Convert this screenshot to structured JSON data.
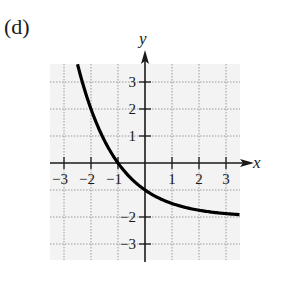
{
  "panel_label": "(d)",
  "colors": {
    "curve": "#000000",
    "axis": "#1a1a1a",
    "grid": "#9a9a9a",
    "grid_background": "#f3f3f3"
  },
  "chart_data": {
    "type": "line",
    "title": "(d)",
    "xlabel": "x",
    "ylabel": "y",
    "xlim": [
      -3.5,
      3.5
    ],
    "ylim": [
      -3.5,
      3.7
    ],
    "grid": true,
    "grid_style": "dotted",
    "x_tick_labels": [
      "−3",
      "−2",
      "−1",
      "1",
      "2",
      "3"
    ],
    "x_ticks": [
      -3,
      -2,
      -1,
      1,
      2,
      3
    ],
    "y_tick_labels": [
      "3",
      "2",
      "1",
      "−2",
      "−3"
    ],
    "y_ticks": [
      3,
      2,
      1,
      -2,
      -3
    ],
    "series": [
      {
        "name": "f(x) = 2^(-x) - 2",
        "x": [
          -2.5,
          -2,
          -1.5,
          -1,
          -0.5,
          0,
          0.5,
          1,
          1.5,
          2,
          2.5,
          3,
          3.5
        ],
        "y": [
          3.66,
          2.0,
          0.83,
          0.0,
          -0.59,
          -1.0,
          -1.29,
          -1.5,
          -1.65,
          -1.75,
          -1.82,
          -1.875,
          -1.91
        ]
      }
    ],
    "annotations": {
      "x_intercept": [
        -1,
        0
      ],
      "y_intercept": [
        0,
        -1
      ],
      "horizontal_asymptote": -2
    }
  }
}
